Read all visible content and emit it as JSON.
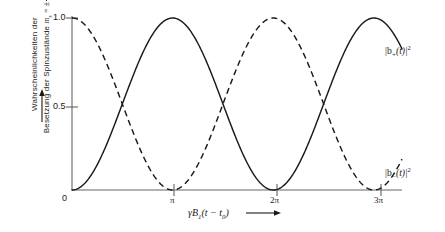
{
  "chart_data": {
    "type": "line",
    "title": "",
    "xlabel": "γB₁(t − t₀)",
    "ylabel": "Wahrscheinlichkeiten der Besetzung der Spinzustände mₛ = ± 1/2",
    "xlim": [
      0,
      10.3
    ],
    "ylim": [
      0,
      1.06
    ],
    "grid": false,
    "legend_position": "inline-right",
    "x_ticks": [
      {
        "value": 0,
        "label": "0"
      },
      {
        "value": 3.14159,
        "label": "π"
      },
      {
        "value": 6.28319,
        "label": "2π"
      },
      {
        "value": 9.42478,
        "label": "3π"
      }
    ],
    "y_ticks": [
      {
        "value": 0,
        "label": "0"
      },
      {
        "value": 0.5,
        "label": "0.5"
      },
      {
        "value": 1.0,
        "label": "1.0"
      }
    ],
    "series": [
      {
        "name": "|b₊(t)|²",
        "style": "solid",
        "color": "#1a1a1a",
        "formula": "sin^2(x/2)",
        "x": [
          0.0,
          0.3217,
          0.6435,
          0.9652,
          1.287,
          1.6087,
          1.9305,
          2.2522,
          2.574,
          2.8957,
          3.2175,
          3.5392,
          3.861,
          4.1827,
          4.5045,
          4.8262,
          5.148,
          5.4697,
          5.7915,
          6.1132,
          6.435,
          6.7567,
          7.0785,
          7.4002,
          7.722,
          8.0437,
          8.3655,
          8.6872,
          9.009,
          9.3307,
          9.6525,
          9.9742,
          10.296
        ],
        "y": [
          0.0,
          0.0256,
          0.1007,
          0.2172,
          0.3632,
          0.5226,
          0.6782,
          0.8132,
          0.9132,
          0.9689,
          0.9747,
          0.9309,
          0.8438,
          0.7242,
          0.5858,
          0.4433,
          0.3108,
          0.2004,
          0.1198,
          0.0722,
          0.0608,
          0.086,
          0.1442,
          0.2297,
          0.3337,
          0.446,
          0.5563,
          0.6546,
          0.733,
          0.886,
          0.954,
          0.9945,
          0.96
        ]
      },
      {
        "name": "|b₋(t)|²",
        "style": "dashed",
        "color": "#1a1a1a",
        "formula": "cos^2(x/2)",
        "x": [
          0.0,
          0.3217,
          0.6435,
          0.9652,
          1.287,
          1.6087,
          1.9305,
          2.2522,
          2.574,
          2.8957,
          3.2175,
          3.5392,
          3.861,
          4.1827,
          4.5045,
          4.8262,
          5.148,
          5.4697,
          5.7915,
          6.1132,
          6.435,
          6.7567,
          7.0785,
          7.4002,
          7.722,
          8.0437,
          8.3655,
          8.6872,
          9.009,
          9.3307,
          9.6525,
          9.9742,
          10.296
        ],
        "y": [
          1.0,
          0.9744,
          0.8993,
          0.7828,
          0.6368,
          0.4774,
          0.3218,
          0.1868,
          0.0868,
          0.0311,
          0.0253,
          0.0691,
          0.1562,
          0.2758,
          0.4142,
          0.5567,
          0.6892,
          0.7996,
          0.8802,
          0.9278,
          0.9392,
          0.914,
          0.8558,
          0.7703,
          0.6663,
          0.554,
          0.4437,
          0.3454,
          0.267,
          0.114,
          0.046,
          0.0055,
          0.04
        ]
      }
    ],
    "annotations": [
      {
        "text": "|b₊(t)|²",
        "x": 9.9,
        "y": 0.84,
        "refers_to": "solid-curve"
      },
      {
        "text": "|b₋(t)|²",
        "x": 9.9,
        "y": 0.17,
        "refers_to": "dashed-curve"
      }
    ]
  },
  "axes": {
    "y_label_line1": "Wahrscheinlichkeiten  der",
    "y_label_line2": "Besetzung  der  Spinzustände",
    "y_label_ms": "m",
    "y_label_ms_sub": "s",
    "y_label_eq": "= ±",
    "y_label_frac_num": "1",
    "y_label_frac_den": "2",
    "y_tick_1": "1.0",
    "y_tick_05": "0.5",
    "y_tick_0": "0",
    "x_tick_pi": "π",
    "x_tick_2pi": "2π",
    "x_tick_3pi": "3π",
    "x_label_gamma": "γB",
    "x_label_gamma_sub": "1",
    "x_label_rest": "(t − t",
    "x_label_sub0": "0",
    "x_label_close": ")"
  },
  "labels": {
    "curve_plus_bar1": "|b",
    "curve_plus_sub": "+",
    "curve_plus_mid": "(t)|",
    "curve_plus_sup": "2",
    "curve_minus_bar1": "|b",
    "curve_minus_sub": "−",
    "curve_minus_mid": "(t)|",
    "curve_minus_sup": "2"
  },
  "colors": {
    "ink": "#1a1a1a",
    "axis": "#555555",
    "background": "#ffffff"
  }
}
